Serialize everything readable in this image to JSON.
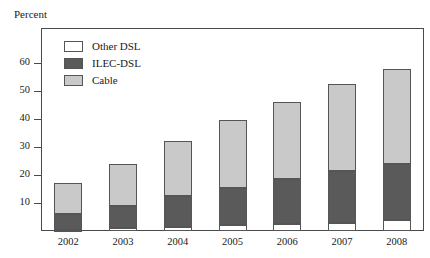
{
  "figure": {
    "top_remnant_text": "",
    "y_axis_title": "Percent"
  },
  "legend": {
    "position": "top-left-inside",
    "items": [
      {
        "label": "Other DSL",
        "color": "#ffffff",
        "key": "other_dsl"
      },
      {
        "label": "ILEC-DSL",
        "color": "#5a5a5a",
        "key": "ilec_dsl"
      },
      {
        "label": "Cable",
        "color": "#c9c9c9",
        "key": "cable"
      }
    ]
  },
  "chart_data": {
    "type": "bar",
    "stacked": true,
    "title": "",
    "subtitle": "",
    "xlabel": "",
    "ylabel": "Percent",
    "categories": [
      "2002",
      "2003",
      "2004",
      "2005",
      "2006",
      "2007",
      "2008"
    ],
    "ylim": [
      0,
      65
    ],
    "yticks": [
      10,
      20,
      30,
      40,
      50,
      60
    ],
    "ytick_labels": [
      "10",
      "20",
      "30",
      "40",
      "50",
      "60"
    ],
    "grid": false,
    "legend_position": "upper left (inside plot area)",
    "stack_order_bottom_to_top": [
      "other_dsl",
      "ilec_dsl",
      "cable"
    ],
    "series": [
      {
        "name": "Other DSL",
        "color": "#ffffff",
        "values": [
          0.5,
          1.0,
          1.5,
          2.0,
          2.5,
          3.0,
          4.0
        ]
      },
      {
        "name": "ILEC-DSL",
        "color": "#5a5a5a",
        "values": [
          5.5,
          8.0,
          11.0,
          13.5,
          16.0,
          18.5,
          20.0
        ]
      },
      {
        "name": "Cable",
        "color": "#c9c9c9",
        "values": [
          11.0,
          15.0,
          19.5,
          24.0,
          27.5,
          31.0,
          34.0
        ]
      }
    ],
    "totals": [
      17.0,
      24.0,
      32.0,
      39.5,
      46.0,
      52.5,
      58.0
    ]
  }
}
